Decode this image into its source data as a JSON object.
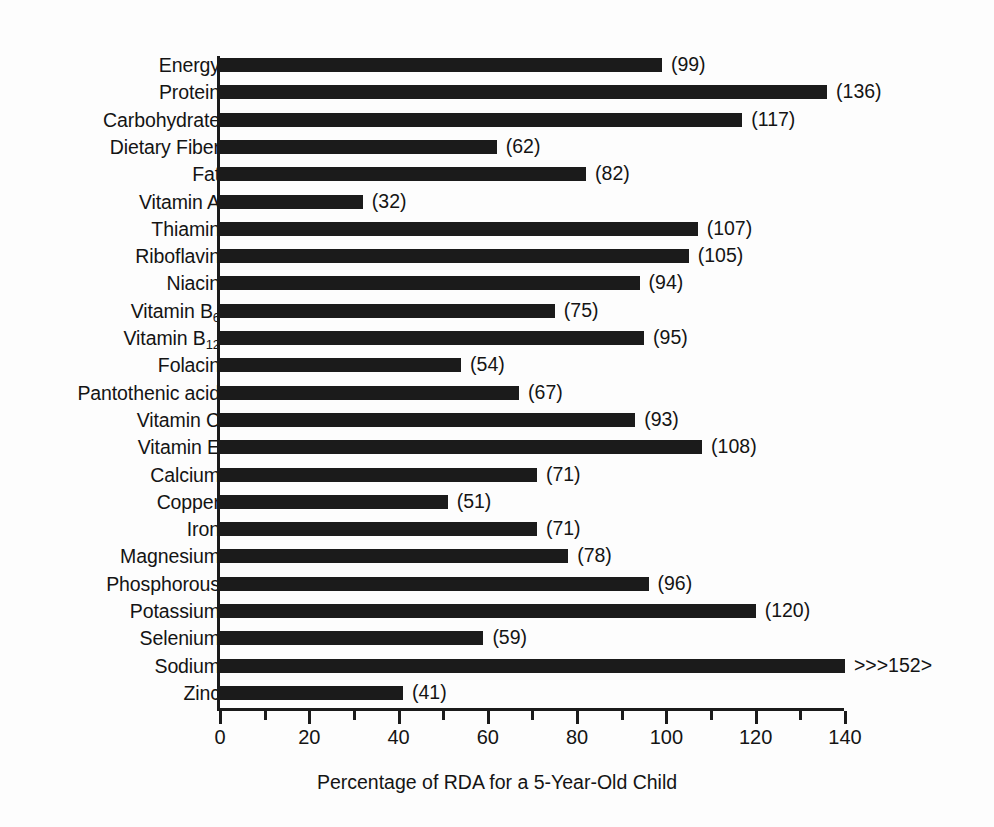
{
  "chart_data": {
    "type": "bar",
    "orientation": "horizontal",
    "title": "",
    "xlabel": "Percentage of RDA for a 5-Year-Old Child",
    "ylabel": "",
    "xlim": [
      0,
      140
    ],
    "xticks": [
      0,
      20,
      40,
      60,
      80,
      100,
      120,
      140
    ],
    "xtick_labels": [
      "0",
      "20",
      "40",
      "60",
      "80",
      "100",
      "120",
      "140"
    ],
    "minor_tick_interval": 10,
    "grid": false,
    "legend": false,
    "bar_color": "#1b1b1b",
    "categories": [
      "Energy",
      "Protein",
      "Carbohydrate",
      "Dietary Fiber",
      "Fat",
      "Vitamin A",
      "Thiamin",
      "Riboflavin",
      "Niacin",
      "Vitamin B6",
      "Vitamin B12",
      "Folacin",
      "Pantothenic acid",
      "Vitamin C",
      "Vitamin E",
      "Calcium",
      "Copper",
      "Iron",
      "Magnesium",
      "Phosphorous",
      "Potassium",
      "Selenium",
      "Sodium",
      "Zinc"
    ],
    "values": [
      99,
      136,
      117,
      62,
      82,
      32,
      107,
      105,
      94,
      75,
      95,
      54,
      67,
      93,
      108,
      71,
      51,
      71,
      78,
      96,
      120,
      59,
      152,
      41
    ],
    "bars": [
      {
        "category": "Energy",
        "label_html": "Energy",
        "value": 99,
        "value_label": "(99)",
        "clipped": false
      },
      {
        "category": "Protein",
        "label_html": "Protein",
        "value": 136,
        "value_label": "(136)",
        "clipped": false
      },
      {
        "category": "Carbohydrate",
        "label_html": "Carbohydrate",
        "value": 117,
        "value_label": "(117)",
        "clipped": false
      },
      {
        "category": "Dietary Fiber",
        "label_html": "Dietary Fiber",
        "value": 62,
        "value_label": "(62)",
        "clipped": false
      },
      {
        "category": "Fat",
        "label_html": "Fat",
        "value": 82,
        "value_label": "(82)",
        "clipped": false
      },
      {
        "category": "Vitamin A",
        "label_html": "Vitamin A",
        "value": 32,
        "value_label": "(32)",
        "clipped": false
      },
      {
        "category": "Thiamin",
        "label_html": "Thiamin",
        "value": 107,
        "value_label": "(107)",
        "clipped": false
      },
      {
        "category": "Riboflavin",
        "label_html": "Riboflavin",
        "value": 105,
        "value_label": "(105)",
        "clipped": false
      },
      {
        "category": "Niacin",
        "label_html": "Niacin",
        "value": 94,
        "value_label": "(94)",
        "clipped": false
      },
      {
        "category": "Vitamin B6",
        "label_html": "Vitamin B<sub>6</sub>",
        "value": 75,
        "value_label": "(75)",
        "clipped": false
      },
      {
        "category": "Vitamin B12",
        "label_html": "Vitamin B<sub>12</sub>",
        "value": 95,
        "value_label": "(95)",
        "clipped": false
      },
      {
        "category": "Folacin",
        "label_html": "Folacin",
        "value": 54,
        "value_label": "(54)",
        "clipped": false
      },
      {
        "category": "Pantothenic acid",
        "label_html": "Pantothenic acid",
        "value": 67,
        "value_label": "(67)",
        "clipped": false
      },
      {
        "category": "Vitamin C",
        "label_html": "Vitamin C",
        "value": 93,
        "value_label": "(93)",
        "clipped": false
      },
      {
        "category": "Vitamin E",
        "label_html": "Vitamin E",
        "value": 108,
        "value_label": "(108)",
        "clipped": false
      },
      {
        "category": "Calcium",
        "label_html": "Calcium",
        "value": 71,
        "value_label": "(71)",
        "clipped": false
      },
      {
        "category": "Copper",
        "label_html": "Copper",
        "value": 51,
        "value_label": "(51)",
        "clipped": false
      },
      {
        "category": "Iron",
        "label_html": "Iron",
        "value": 71,
        "value_label": "(71)",
        "clipped": false
      },
      {
        "category": "Magnesium",
        "label_html": "Magnesium",
        "value": 78,
        "value_label": "(78)",
        "clipped": false
      },
      {
        "category": "Phosphorous",
        "label_html": "Phosphorous",
        "value": 96,
        "value_label": "(96)",
        "clipped": false
      },
      {
        "category": "Potassium",
        "label_html": "Potassium",
        "value": 120,
        "value_label": "(120)",
        "clipped": false
      },
      {
        "category": "Selenium",
        "label_html": "Selenium",
        "value": 59,
        "value_label": "(59)",
        "clipped": false
      },
      {
        "category": "Sodium",
        "label_html": "Sodium",
        "value": 152,
        "value_label": ">>>152>",
        "clipped": true
      },
      {
        "category": "Zinc",
        "label_html": "Zinc",
        "value": 41,
        "value_label": "(41)",
        "clipped": false
      }
    ]
  }
}
